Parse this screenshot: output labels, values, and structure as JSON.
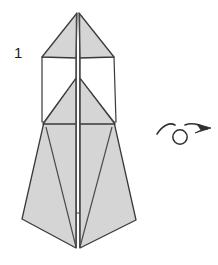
{
  "diagram": {
    "kind": "origami-folding-step",
    "step_label": "1",
    "canvas": {
      "width": 218,
      "height": 265
    },
    "colors": {
      "paper_front": "#d5d5d5",
      "paper_back": "#ffffff",
      "outline": "#3a3a3a",
      "crease": "#4a4a4a",
      "background": "#ffffff",
      "arrow": "#2f2f2f",
      "label_text": "#1b1b1b"
    },
    "model": {
      "name": "tall-pointed-base",
      "apex": {
        "x": 78,
        "y": 13
      },
      "bottom_point": {
        "x": 78,
        "y": 248
      },
      "left_corner": {
        "x": 22,
        "y": 219
      },
      "right_corner": {
        "x": 136,
        "y": 220
      },
      "center_spine_x": 78,
      "parts": [
        {
          "name": "upper-left-wing",
          "fill": "paper_front"
        },
        {
          "name": "upper-right-wing",
          "fill": "paper_front"
        },
        {
          "name": "left-white-panel",
          "fill": "paper_back"
        },
        {
          "name": "right-white-panel",
          "fill": "paper_back"
        },
        {
          "name": "middle-left-flap",
          "fill": "paper_front"
        },
        {
          "name": "middle-right-flap",
          "fill": "paper_front"
        },
        {
          "name": "lower-left-body",
          "fill": "paper_front"
        },
        {
          "name": "lower-right-body",
          "fill": "paper_front"
        }
      ]
    },
    "symbol": {
      "name": "turn-over-arrow",
      "meaning": "turn the model over",
      "loop_center": {
        "x": 180,
        "y": 137
      },
      "loop_radius": 7,
      "arrow_tip": {
        "x": 211,
        "y": 127
      }
    }
  }
}
